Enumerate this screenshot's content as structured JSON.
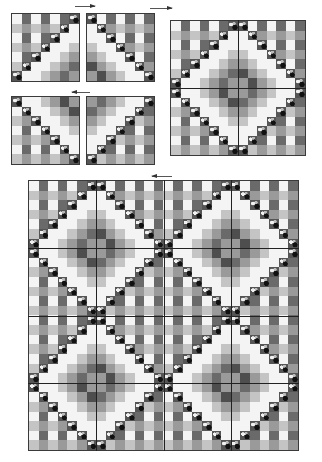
{
  "figure": {
    "palette": {
      "white": "#f4f4f4",
      "light": "#c4c4c4",
      "mid": "#9a9a9a",
      "dark": "#6a6a6a",
      "darker": "#4e4e4e",
      "border": "#3a3a3a",
      "floral": "#555555"
    },
    "panels": [
      {
        "id": "block-top-left",
        "x": 11,
        "y": 13,
        "size": 69,
        "cells": 7,
        "offsetRow": 0,
        "offsetCol": 0
      },
      {
        "id": "block-top-right",
        "x": 86,
        "y": 13,
        "size": 69,
        "cells": 7,
        "offsetRow": 0,
        "offsetCol": 7
      },
      {
        "id": "block-bottom-left",
        "x": 11,
        "y": 96,
        "size": 69,
        "cells": 7,
        "offsetRow": 7,
        "offsetCol": 0
      },
      {
        "id": "block-bottom-right",
        "x": 86,
        "y": 96,
        "size": 69,
        "cells": 7,
        "offsetRow": 7,
        "offsetCol": 7
      },
      {
        "id": "diamond-block",
        "x": 170,
        "y": 20,
        "size": 136,
        "cells": 14,
        "offsetRow": 0,
        "offsetCol": 0,
        "tiles": 1
      },
      {
        "id": "quilt-assembly",
        "x": 28,
        "y": 180,
        "size": 271,
        "cells": 28,
        "offsetRow": 0,
        "offsetCol": 0,
        "tiles": 2
      }
    ],
    "arrows": [
      {
        "id": "arrow-top",
        "x": 75,
        "y": 6,
        "w": 20,
        "dir": "right"
      },
      {
        "id": "arrow-top-right",
        "x": 150,
        "y": 8,
        "w": 22,
        "dir": "right"
      },
      {
        "id": "arrow-middle",
        "x": 72,
        "y": 92,
        "w": 18,
        "dir": "left"
      },
      {
        "id": "arrow-bottom",
        "x": 152,
        "y": 176,
        "w": 20,
        "dir": "left"
      }
    ]
  }
}
